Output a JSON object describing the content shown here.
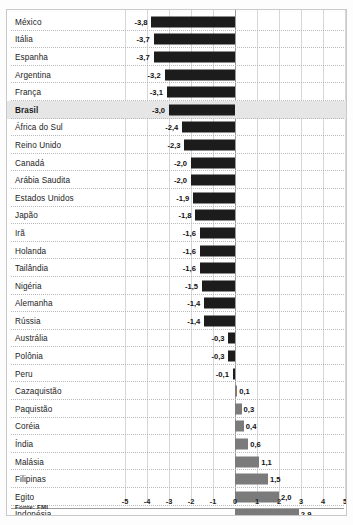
{
  "chart_data": {
    "type": "bar",
    "orientation": "horizontal",
    "title": "",
    "subtitle": "",
    "xlabel": "",
    "ylabel": "",
    "xlim": [
      -5,
      5
    ],
    "xticks": [
      "-5",
      "-4",
      "-3",
      "-2",
      "-1",
      "0",
      "1",
      "2",
      "3",
      "4",
      "5"
    ],
    "xtick_values": [
      -5,
      -4,
      -3,
      -2,
      -1,
      0,
      1,
      2,
      3,
      4,
      5
    ],
    "grid": true,
    "legend": false,
    "decimal_separator": ",",
    "categories": [
      "México",
      "Itália",
      "Espanha",
      "Argentina",
      "França",
      "Brasil",
      "África do Sul",
      "Reino Unido",
      "Canadá",
      "Arábia Saudita",
      "Estados Unidos",
      "Japão",
      "Irã",
      "Holanda",
      "Tailândia",
      "Nigéria",
      "Alemanha",
      "Rússia",
      "Austrália",
      "Polônia",
      "Peru",
      "Cazaquistão",
      "Paquistão",
      "Coréia",
      "Índia",
      "Malásia",
      "Filipinas",
      "Egito",
      "Indonésia",
      "China"
    ],
    "values": [
      -3.8,
      -3.7,
      -3.7,
      -3.2,
      -3.1,
      -3.0,
      -2.4,
      -2.3,
      -2.0,
      -2.0,
      -1.9,
      -1.8,
      -1.6,
      -1.6,
      -1.6,
      -1.5,
      -1.4,
      -1.4,
      -0.3,
      -0.3,
      -0.1,
      0.1,
      0.3,
      0.4,
      0.6,
      1.1,
      1.5,
      2.0,
      2.9,
      4.5
    ],
    "labels": [
      "-3,8",
      "-3,7",
      "-3,7",
      "-3,2",
      "-3,1",
      "-3,0",
      "-2,4",
      "-2,3",
      "-2,0",
      "-2,0",
      "-1,9",
      "-1,8",
      "-1,6",
      "-1,6",
      "-1,6",
      "-1,5",
      "-1,4",
      "-1,4",
      "-0,3",
      "-0,3",
      "-0,1",
      "0,1",
      "0,3",
      "0,4",
      "0,6",
      "1,1",
      "1,5",
      "2,0",
      "2,9",
      "4,5"
    ],
    "highlighted_category": "Brasil",
    "colors": {
      "negative_bar": "#1c1c1c",
      "positive_bar": "#7b7b7b",
      "highlight_row": "#e6e6e6",
      "gridline": "#d6d6d6",
      "zero_line": "#9a9a9a",
      "text": "#111111"
    }
  },
  "footer": {
    "source": "Fonte: FMI"
  }
}
